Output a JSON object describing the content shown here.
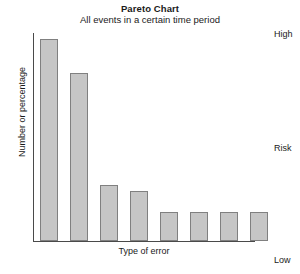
{
  "chart_data": {
    "type": "bar",
    "title": "Pareto Chart",
    "subtitle": "All events in a certain time period",
    "xlabel": "Type of error",
    "ylabel": "Number or percentage",
    "grid": false,
    "legend": "none",
    "ylim": [
      0,
      100
    ],
    "categories": [
      "1",
      "2",
      "3",
      "4",
      "5",
      "6",
      "7",
      "8"
    ],
    "values": [
      97,
      81,
      27,
      24,
      14,
      14,
      14,
      14
    ],
    "bar_fill_color": "#c6c6c6",
    "bar_border_color": "#808080",
    "axis_color": "#4a4a4a",
    "annotations": [
      {
        "text": "High",
        "position": "right-top"
      },
      {
        "text": "Risk",
        "position": "right-middle"
      },
      {
        "text": "Low",
        "position": "right-bottom"
      }
    ]
  },
  "risk_scale": {
    "high_label": "High",
    "middle_label": "Risk",
    "low_label": "Low"
  }
}
